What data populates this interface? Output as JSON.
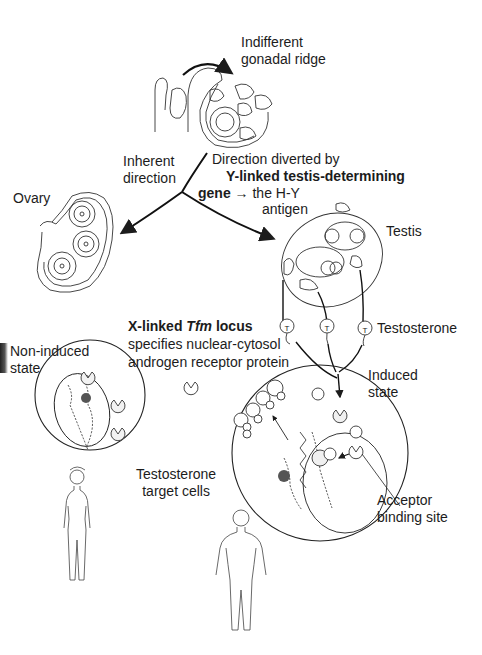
{
  "figure": {
    "labels": {
      "gonadal_ridge": [
        "Indifferent",
        "gonadal ridge"
      ],
      "inherent_direction": [
        "Inherent",
        "direction"
      ],
      "diverted": {
        "line1": "Direction diverted by",
        "line2_bold": "Y-linked testis-determining",
        "line3_bold": "gene",
        "line3_rest": "the H-Y",
        "line4": "antigen"
      },
      "ovary": "Ovary",
      "testis": "Testis",
      "tfm": {
        "bold_prefix": "X-linked ",
        "bold_italic": "Tfm",
        "bold_suffix": " locus",
        "line2": "specifies nuclear-cytosol",
        "line3": "androgen receptor protein"
      },
      "testosterone": "Testosterone",
      "non_induced": [
        "Non-induced",
        "state"
      ],
      "induced": [
        "Induced",
        "state"
      ],
      "target_cells": [
        "Testosterone",
        "target cells"
      ],
      "acceptor": [
        "Acceptor",
        "binding site"
      ],
      "hormone_symbol": "T",
      "arrow_symbol": "→"
    },
    "nodes": [
      {
        "id": "indifferent-gonadal-ridge",
        "type": "tissue"
      },
      {
        "id": "ovary",
        "type": "organ"
      },
      {
        "id": "testis",
        "type": "organ"
      },
      {
        "id": "testosterone",
        "type": "hormone",
        "count": 3
      },
      {
        "id": "non-induced-cell",
        "type": "cell"
      },
      {
        "id": "induced-cell",
        "type": "cell"
      },
      {
        "id": "female-figure",
        "type": "illustration"
      },
      {
        "id": "male-figure",
        "type": "illustration"
      }
    ],
    "edges": [
      {
        "from": "indifferent-gonadal-ridge",
        "to": "ovary",
        "label": "Inherent direction"
      },
      {
        "from": "indifferent-gonadal-ridge",
        "to": "testis",
        "label": "Direction diverted by Y-linked testis-determining gene → the H-Y antigen"
      },
      {
        "from": "testis",
        "to": "testosterone"
      },
      {
        "from": "testosterone",
        "to": "induced-cell"
      }
    ],
    "colors": {
      "ink": "#1c1c1c",
      "line": "#2a2a2a",
      "background": "#ffffff",
      "fill_light": "#e8e8e8"
    }
  }
}
